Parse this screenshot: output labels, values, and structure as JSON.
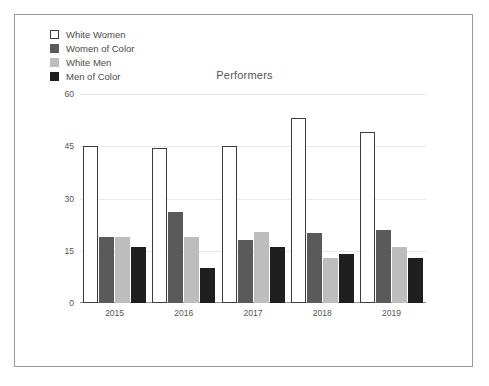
{
  "chart_data": {
    "type": "bar",
    "title": "Performers",
    "xlabel": "",
    "ylabel": "",
    "categories": [
      "2015",
      "2016",
      "2017",
      "2018",
      "2019"
    ],
    "series": [
      {
        "name": "White Women",
        "color": "#ffffff",
        "values": [
          45,
          44.5,
          45,
          53,
          49
        ]
      },
      {
        "name": "Women of Color",
        "color": "#5a5a5a",
        "values": [
          19,
          26,
          18,
          20,
          21
        ]
      },
      {
        "name": "White Men",
        "color": "#bdbdbd",
        "values": [
          19,
          19,
          20.5,
          13,
          16
        ]
      },
      {
        "name": "Men of Color",
        "color": "#1f1f1f",
        "values": [
          16,
          10,
          16,
          14,
          13
        ]
      }
    ],
    "ylim": [
      0,
      60
    ],
    "yticks": [
      60,
      45,
      30,
      15,
      0
    ],
    "grid": true,
    "legend_position": "top-left"
  },
  "legend": {
    "items": [
      {
        "label": "White Women",
        "swatch": "white-outlined-square"
      },
      {
        "label": "Women of Color",
        "swatch": "dark-gray-square"
      },
      {
        "label": "White Men",
        "swatch": "light-gray-square"
      },
      {
        "label": "Men of Color",
        "swatch": "black-square"
      }
    ]
  }
}
